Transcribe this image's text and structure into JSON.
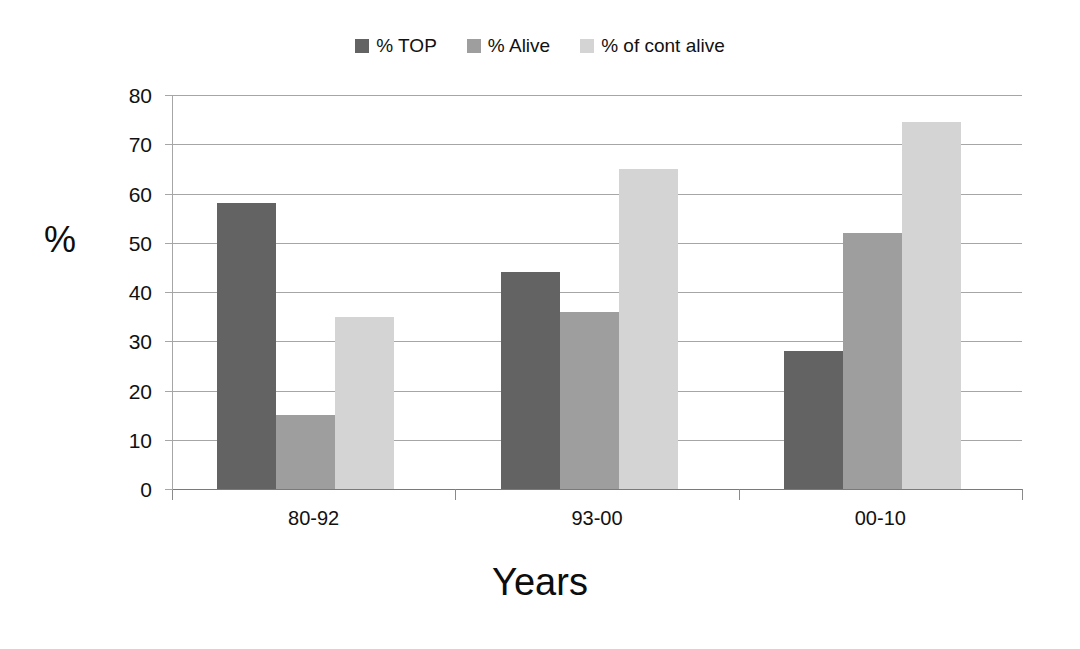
{
  "chart_data": {
    "type": "bar",
    "title": "",
    "categories": [
      "80-92",
      "93-00",
      "00-10"
    ],
    "series": [
      {
        "name": "% TOP",
        "color": "#636363",
        "values": [
          58,
          44,
          28
        ]
      },
      {
        "name": "% Alive",
        "color": "#9e9e9e",
        "values": [
          15,
          36,
          52
        ]
      },
      {
        "name": "% of cont alive",
        "color": "#d4d4d4",
        "values": [
          35,
          65,
          74.5
        ]
      }
    ],
    "xlabel": "Years",
    "ylabel": "%",
    "ylim": [
      0,
      80
    ],
    "yticks": [
      0,
      10,
      20,
      30,
      40,
      50,
      60,
      70,
      80
    ],
    "ytick_labels": [
      "0",
      "10",
      "20",
      "30",
      "40",
      "50",
      "60",
      "70",
      "80"
    ],
    "grid": true,
    "grid_axis": "y",
    "legend_position": "top-center",
    "bar_gap_within_group": 0,
    "background_color": "#ffffff",
    "gridline_color": "#a6a6a6",
    "text_color": "#111111"
  }
}
